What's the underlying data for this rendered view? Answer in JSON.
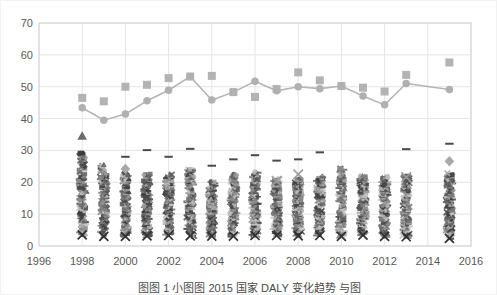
{
  "figure": {
    "caption": "图图 1   小图图 2015 国家 DALY 变化趋势 与图",
    "background_color": "#ffffff",
    "border_color": "#f2f2f2"
  },
  "chart_data": {
    "type": "scatter",
    "title": "",
    "xlabel": "",
    "ylabel": "",
    "xlim": [
      1996,
      2016
    ],
    "ylim": [
      0,
      70
    ],
    "xticks": [
      1996,
      1998,
      2000,
      2002,
      2004,
      2006,
      2008,
      2010,
      2012,
      2014,
      2016
    ],
    "yticks": [
      0,
      10,
      20,
      30,
      40,
      50,
      60,
      70
    ],
    "xtick_labels": [
      "1996",
      "1998",
      "2000",
      "2002",
      "2004",
      "2006",
      "2008",
      "2010",
      "2012",
      "2014",
      "2016"
    ],
    "ytick_labels": [
      "0",
      "10",
      "20",
      "30",
      "40",
      "50",
      "60",
      "70"
    ],
    "grid": true,
    "legend": "none",
    "colors": {
      "line": "#b5b5b5",
      "circle_marker": "#b0b0b0",
      "square_marker": "#b3b3b3",
      "cluster_dark": "#3a3a3a",
      "cluster_mid": "#7d7d7d",
      "cluster_light": "#a8a8a8",
      "grid": "#e4e4e4",
      "axis_text": "#595959"
    },
    "series": [
      {
        "name": "max-series-squares",
        "marker": "square",
        "connected": false,
        "x": [
          1998,
          1999,
          2000,
          2001,
          2002,
          2003,
          2004,
          2005,
          2006,
          2007,
          2008,
          2009,
          2010,
          2011,
          2012,
          2013,
          2015
        ],
        "values": [
          46.5,
          45.4,
          50.0,
          50.6,
          52.7,
          53.2,
          53.4,
          48.3,
          46.8,
          49.3,
          54.5,
          52.0,
          50.2,
          49.7,
          48.5,
          53.7,
          57.6
        ]
      },
      {
        "name": "mean-series-line-circles",
        "marker": "circle",
        "connected": true,
        "x": [
          1998,
          1999,
          2000,
          2001,
          2002,
          2003,
          2004,
          2005,
          2006,
          2007,
          2008,
          2009,
          2010,
          2011,
          2012,
          2013,
          2015
        ],
        "values": [
          43.4,
          39.5,
          41.4,
          45.6,
          48.9,
          53.2,
          45.8,
          48.3,
          51.7,
          48.7,
          50.0,
          49.4,
          50.2,
          47.1,
          44.3,
          51.0,
          49.1
        ]
      },
      {
        "name": "high-outlier-dashes",
        "marker": "dash",
        "connected": false,
        "x": [
          2000,
          2001,
          2002,
          2003,
          2004,
          2005,
          2006,
          2007,
          2008,
          2009,
          2013,
          2015
        ],
        "values": [
          28.0,
          30.1,
          28.0,
          30.5,
          25.2,
          27.2,
          28.5,
          26.8,
          27.2,
          29.4,
          30.4,
          32.1
        ]
      },
      {
        "name": "triangle-outlier",
        "marker": "triangle",
        "connected": false,
        "x": [
          1998
        ],
        "values": [
          34.5
        ]
      },
      {
        "name": "diamond-outliers",
        "marker": "diamond",
        "connected": false,
        "x": [
          2000,
          2015
        ],
        "values": [
          24.2,
          26.6
        ]
      },
      {
        "name": "x-outliers",
        "marker": "x",
        "connected": false,
        "x": [
          2007,
          2008,
          2013
        ],
        "values": [
          20.4,
          22.5,
          21.6
        ]
      },
      {
        "name": "country-cluster-distribution",
        "marker": "mixed",
        "connected": false,
        "description": "Dense overlapping cluster of many country markers per year",
        "x": [
          1998,
          1999,
          2000,
          2001,
          2002,
          2003,
          2004,
          2005,
          2006,
          2007,
          2008,
          2009,
          2010,
          2011,
          2012,
          2013,
          2015
        ],
        "cluster_top": [
          29.6,
          25.7,
          23.0,
          22.6,
          22.5,
          24.4,
          20.1,
          22.7,
          23.3,
          21.0,
          21.4,
          21.9,
          24.6,
          22.1,
          22.0,
          22.3,
          22.8
        ],
        "cluster_bottom": [
          3.5,
          3.0,
          3.0,
          3.2,
          3.3,
          3.2,
          3.1,
          3.1,
          3.3,
          3.3,
          3.2,
          3.3,
          3.0,
          3.4,
          3.0,
          2.9,
          2.4
        ]
      }
    ]
  }
}
